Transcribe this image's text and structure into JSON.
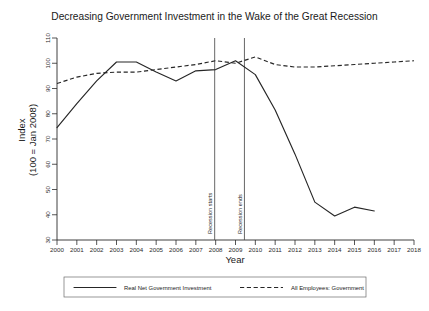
{
  "chart_data": {
    "type": "line",
    "title": "Decreasing Government Investment in the Wake of the Great Recession",
    "xlabel": "Year",
    "ylabel_line1": "Index",
    "ylabel_line2": "(100 = Jan 2008)",
    "xlim": [
      2000,
      2018
    ],
    "ylim": [
      30,
      110
    ],
    "grid": false,
    "legend_position": "below-axis",
    "x_ticks": [
      2000,
      2001,
      2002,
      2003,
      2004,
      2005,
      2006,
      2007,
      2008,
      2009,
      2010,
      2011,
      2012,
      2013,
      2014,
      2015,
      2016,
      2017,
      2018
    ],
    "y_ticks": [
      30,
      40,
      50,
      60,
      70,
      80,
      90,
      100,
      110
    ],
    "series": [
      {
        "name": "Real Net Government Investment",
        "style": "solid",
        "color": "#262626",
        "x": [
          2000,
          2001,
          2002,
          2003,
          2004,
          2005,
          2006,
          2007,
          2008,
          2009,
          2010,
          2011,
          2012,
          2013,
          2014,
          2015,
          2016
        ],
        "values": [
          74.5,
          84.0,
          93.0,
          100.5,
          100.5,
          96.5,
          93.0,
          97.0,
          97.5,
          101.0,
          95.5,
          81.5,
          64.0,
          45.0,
          39.5,
          43.0,
          41.5
        ]
      },
      {
        "name": "All Employees: Government",
        "style": "dashed",
        "color": "#262626",
        "x": [
          2000,
          2001,
          2002,
          2003,
          2004,
          2005,
          2006,
          2007,
          2008,
          2009,
          2010,
          2011,
          2012,
          2013,
          2014,
          2015,
          2016,
          2017,
          2018
        ],
        "values": [
          92.0,
          94.5,
          96.0,
          96.5,
          96.5,
          97.5,
          98.5,
          99.5,
          101.0,
          100.0,
          102.5,
          99.5,
          98.5,
          98.5,
          99.0,
          99.5,
          100.0,
          100.5,
          101.0
        ]
      }
    ],
    "annotations": [
      {
        "label": "Recession starts",
        "x": 2007.95,
        "orientation": "vertical"
      },
      {
        "label": "Recession ends",
        "x": 2009.45,
        "orientation": "vertical"
      }
    ]
  }
}
